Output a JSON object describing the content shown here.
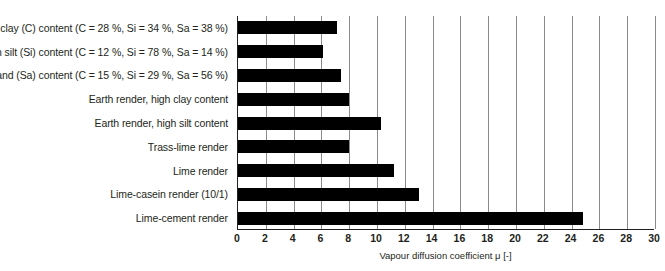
{
  "chart_data": {
    "type": "bar",
    "orientation": "horizontal",
    "title": "",
    "xlabel": "Vapour diffusion coefficient μ [-]",
    "ylabel": "",
    "xlim": [
      0,
      30
    ],
    "xtick_step": 2,
    "xticks": [
      "0",
      "2",
      "4",
      "6",
      "8",
      "10",
      "12",
      "14",
      "16",
      "18",
      "20",
      "22",
      "24",
      "26",
      "28",
      "30"
    ],
    "grid": "vertical",
    "legend": "none",
    "bar_color": "#000000",
    "categories": [
      "Earth, high clay (C) content (C = 28 %, Si = 34 %, Sa = 38 %)",
      "Earth, high silt (Si) content (C = 12 %, Si = 78 %, Sa = 14 %)",
      "arth, high sand (Sa) content  (C = 15 %, Si = 29 %, Sa = 56 %)",
      "Earth render, high clay content",
      "Earth render, high silt content",
      "Trass-lime render",
      "Lime render",
      "Lime-casein render (10/1)",
      "Lime-cement render"
    ],
    "values": [
      7.1,
      6.1,
      7.4,
      8.0,
      10.3,
      8.0,
      11.2,
      13.0,
      24.8
    ]
  }
}
